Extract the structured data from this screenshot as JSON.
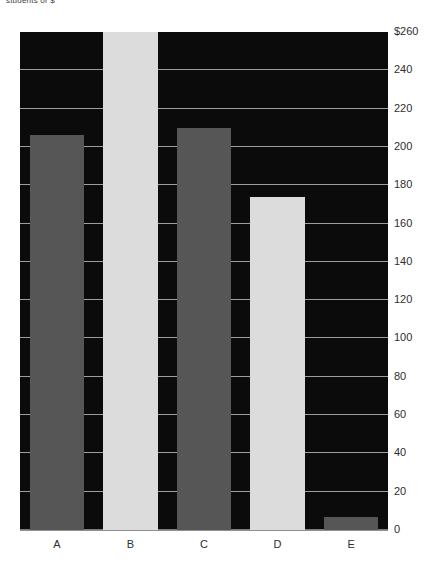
{
  "caption": "students or $",
  "chart_data": {
    "type": "bar",
    "title": "",
    "subtitle": "",
    "xlabel": "",
    "ylabel": "",
    "categories": [
      "A",
      "B",
      "C",
      "D",
      "E"
    ],
    "values": [
      206,
      260,
      210,
      174,
      7
    ],
    "series": [
      {
        "name": "values",
        "values": [
          206,
          260,
          210,
          174,
          7
        ]
      }
    ],
    "bar_colors": [
      "#565656",
      "#dcdcdc",
      "#565656",
      "#dcdcdc",
      "#565656"
    ],
    "ylim": [
      0,
      260
    ],
    "xlim_categories": 5,
    "ytick_values": [
      0,
      20,
      40,
      60,
      80,
      100,
      120,
      140,
      160,
      180,
      200,
      220,
      240,
      260
    ],
    "ytick_labels": [
      "0",
      "20",
      "40",
      "60",
      "80",
      "100",
      "120",
      "140",
      "160",
      "180",
      "200",
      "220",
      "240",
      "$260"
    ],
    "ytick_position": "right",
    "xtick_labels": [
      "A",
      "B",
      "C",
      "D",
      "E"
    ],
    "grid": true,
    "grid_axis": "y",
    "legend": false,
    "legend_position": "none",
    "plot_background": "#0b0b0b",
    "figure_background": "#ffffff",
    "gridline_color": "#b8b8b8",
    "tick_label_color": "#2e2e2e",
    "annotations": []
  }
}
